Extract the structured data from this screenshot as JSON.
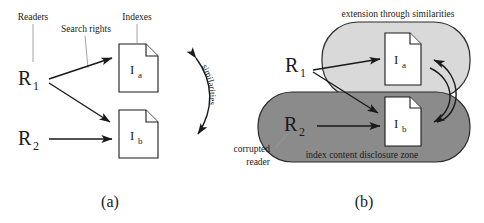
{
  "figure": {
    "type": "diagram",
    "colors": {
      "ink": "#1a1a1a",
      "leader_line": "#9a9a9a",
      "zone_light_fill": "#d9d9d9",
      "zone_dark_fill": "#8b8b8b",
      "document_fill": "#ffffff",
      "background": "#ffffff"
    }
  },
  "panel_a": {
    "caption": "(a)",
    "annotations": {
      "readers": "Readers",
      "search_rights": "Search rights",
      "indexes": "Indexes",
      "similarities": "similarities"
    },
    "readers": [
      {
        "id": "R1",
        "base": "R",
        "subscript": "1"
      },
      {
        "id": "R2",
        "base": "R",
        "subscript": "2"
      }
    ],
    "indexes": [
      {
        "id": "Ia",
        "base": "I",
        "subscript": "a"
      },
      {
        "id": "Ib",
        "base": "I",
        "subscript": "b"
      }
    ],
    "edges": [
      {
        "from": "R1",
        "to": "Ia",
        "style": "straight-arrow"
      },
      {
        "from": "R1",
        "to": "Ib",
        "style": "straight-arrow"
      },
      {
        "from": "R2",
        "to": "Ib",
        "style": "straight-arrow"
      },
      {
        "from": "Ia",
        "to": "Ib",
        "style": "curved-double-arrow",
        "label": "similarities"
      }
    ]
  },
  "panel_b": {
    "caption": "(b)",
    "annotations": {
      "extension": "extension through similarities",
      "corrupted_reader_line1": "corrupted",
      "corrupted_reader_line2": "reader",
      "disclosure_zone": "index content disclosure zone"
    },
    "readers": [
      {
        "id": "R1",
        "base": "R",
        "subscript": "1"
      },
      {
        "id": "R2",
        "base": "R",
        "subscript": "2"
      }
    ],
    "indexes": [
      {
        "id": "Ia",
        "base": "I",
        "subscript": "a"
      },
      {
        "id": "Ib",
        "base": "I",
        "subscript": "b"
      }
    ],
    "zones": [
      {
        "name": "extension through similarities",
        "shade": "light",
        "contains": [
          "Ia"
        ]
      },
      {
        "name": "index content disclosure zone",
        "shade": "dark",
        "contains": [
          "R2",
          "Ib"
        ]
      }
    ],
    "edges": [
      {
        "from": "R1",
        "to": "Ia",
        "style": "straight-arrow"
      },
      {
        "from": "R1",
        "to": "Ib",
        "style": "straight-arrow"
      },
      {
        "from": "R2",
        "to": "Ib",
        "style": "straight-arrow"
      },
      {
        "from": "Ib",
        "to": "Ia",
        "style": "curved-arrow"
      },
      {
        "from": "Ia",
        "to": "Ib",
        "style": "curved-arrow"
      }
    ]
  }
}
